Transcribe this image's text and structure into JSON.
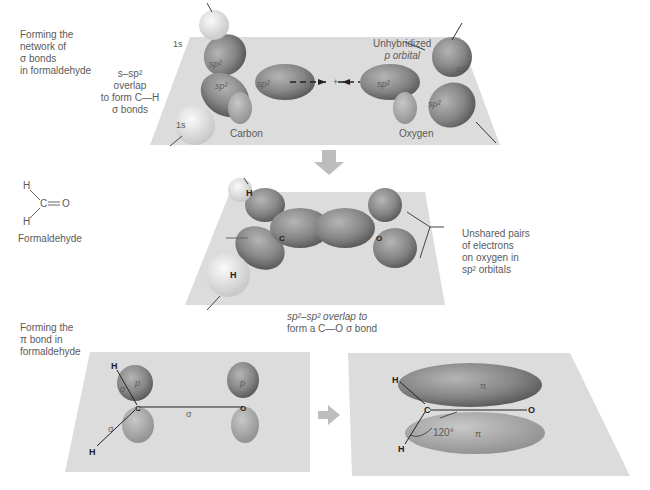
{
  "panel1": {
    "side_label": [
      "Forming the",
      "network of",
      "σ bonds",
      "in formaldehyde"
    ],
    "overlap_label": [
      "s–sp² overlap",
      "to form C—H",
      "σ bonds"
    ],
    "carbon_label": "Carbon",
    "oxygen_label": "Oxygen",
    "unhybridized_label": [
      "Unhybridized",
      "p orbital"
    ],
    "orbital_labels": {
      "s": "1s",
      "sp2": "sp²",
      "C": "C",
      "O": "O",
      "plus": "+"
    }
  },
  "structure": {
    "label": "Formaldehyde",
    "atoms": [
      "H",
      "C",
      "O",
      "H"
    ]
  },
  "panel2": {
    "unshared_label": [
      "Unshared pairs",
      "of electrons",
      "on oxygen in",
      "sp² orbitals"
    ],
    "overlap_caption": [
      "sp²–sp² overlap to",
      "form a C—O σ bond"
    ],
    "atoms": {
      "H": "H",
      "C": "C",
      "O": "O"
    }
  },
  "panel3": {
    "side_label": [
      "Forming the",
      "π bond in",
      "formaldehyde"
    ],
    "left": {
      "p": "p",
      "sigma": "σ",
      "H": "H",
      "C": "C",
      "O": "O"
    },
    "right": {
      "pi": "π",
      "angle": "120°",
      "H": "H",
      "C": "C",
      "O": "O"
    }
  },
  "colors": {
    "plane": "#dcdcdc",
    "orbital": "#8a8a8a",
    "orbital_dark": "#5e5e5e",
    "hydrogen": "#e6e6e6",
    "arrow": "#bdbdbd"
  }
}
